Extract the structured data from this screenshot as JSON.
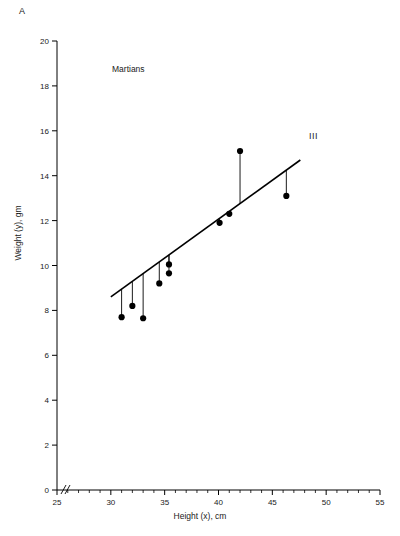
{
  "panel": {
    "label": "A"
  },
  "chart_data": {
    "type": "scatter",
    "title": "",
    "series_label": "Martians",
    "line_label": "III",
    "xlabel": "Height (x), cm",
    "ylabel": "Weight (y), gm",
    "xlim": [
      25,
      55
    ],
    "ylim": [
      0,
      20
    ],
    "xticks": [
      25,
      30,
      35,
      40,
      45,
      50,
      55
    ],
    "yticks": [
      0,
      2,
      4,
      6,
      8,
      10,
      12,
      14,
      16,
      18,
      20
    ],
    "xtick_labels": [
      "25",
      "30",
      "35",
      "40",
      "45",
      "50",
      "55"
    ],
    "ytick_labels": [
      "0",
      "2",
      "4",
      "6",
      "8",
      "10",
      "12",
      "14",
      "16",
      "18",
      "20"
    ],
    "x_minor_tick_step": 1,
    "axis_break": true,
    "grid": false,
    "legend": "none",
    "marker": "filled-circle",
    "marker_color": "#000000",
    "line_color": "#000000",
    "points": [
      {
        "x": 31.0,
        "y": 7.7
      },
      {
        "x": 32.0,
        "y": 8.2
      },
      {
        "x": 33.0,
        "y": 7.65
      },
      {
        "x": 34.5,
        "y": 9.2
      },
      {
        "x": 35.4,
        "y": 10.05
      },
      {
        "x": 35.4,
        "y": 9.65
      },
      {
        "x": 40.1,
        "y": 11.9
      },
      {
        "x": 41.0,
        "y": 12.3
      },
      {
        "x": 42.0,
        "y": 15.1
      },
      {
        "x": 46.3,
        "y": 13.1
      }
    ],
    "fit_line": {
      "x0": 30.0,
      "y0": 8.6,
      "x1": 47.6,
      "y1": 14.7
    },
    "residual_drops": true
  }
}
